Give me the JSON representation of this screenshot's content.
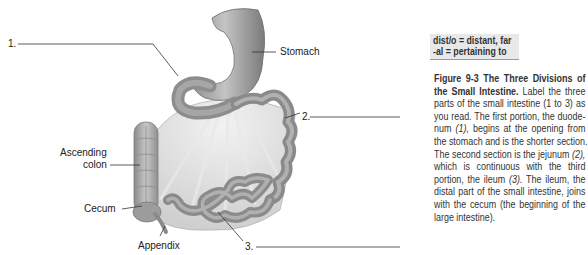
{
  "diagram": {
    "labels": {
      "blank1": "1.",
      "blank2": "2.",
      "blank3": "3.",
      "stomach": "Stomach",
      "ascending_colon_line1": "Ascending",
      "ascending_colon_line2": "colon",
      "cecum": "Cecum",
      "appendix": "Appendix"
    }
  },
  "definitions": [
    {
      "text": "dist/o = distant, far"
    },
    {
      "text": "-al = pertaining to"
    }
  ],
  "caption": {
    "figure_number": "Figure 9-3",
    "title_part1": "The Three Divisions of",
    "title_part2": "the Small Intestine.",
    "lines": [
      " Label the three",
      "parts of the small intestine (1 to 3) as",
      "you read. The first portion, the duode-",
      "num ",
      "(1),",
      " begins at the opening from",
      "the stomach and is the shorter section.",
      "The second section is the jejunum ",
      "(2),",
      "which is continuous with the third",
      "portion, the ileum ",
      "(3).",
      " The ileum, the",
      "distal part of the small intestine, joins",
      "with the cecum (the beginning of the",
      "large intestine)."
    ]
  }
}
